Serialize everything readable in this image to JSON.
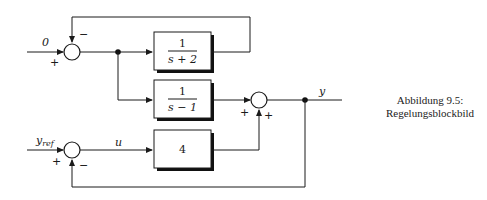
{
  "caption": {
    "line1": "Abbildung 9.5:",
    "line2": "Regelungsblockbild"
  },
  "blocks": [
    {
      "id": "block-1",
      "numerator": "1",
      "denominator": "s + 2"
    },
    {
      "id": "block-2",
      "numerator": "1",
      "denominator": "s − 1"
    },
    {
      "id": "block-3",
      "gain": "4"
    }
  ],
  "signals": {
    "input_top": "0",
    "input_bottom_base": "y",
    "input_bottom_sub": "ref",
    "control": "u",
    "output": "y"
  },
  "summing_junctions": [
    {
      "id": "sum-1",
      "signs": {
        "left": "+",
        "top": "−"
      }
    },
    {
      "id": "sum-2",
      "signs": {
        "left": "+",
        "bottom": "+"
      }
    },
    {
      "id": "sum-3",
      "signs": {
        "left": "+",
        "bottom": "−"
      }
    }
  ]
}
